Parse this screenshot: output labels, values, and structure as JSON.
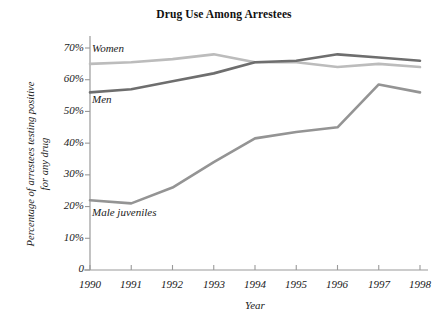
{
  "chart_data": {
    "type": "line",
    "title": "Drug Use Among Arrestees",
    "xlabel": "Year",
    "ylabel": "Percentage of arrestees testing positive\nfor any drug",
    "categories": [
      "1990",
      "1991",
      "1992",
      "1993",
      "1994",
      "1995",
      "1996",
      "1997",
      "1998"
    ],
    "x": [
      1990,
      1991,
      1992,
      1993,
      1994,
      1995,
      1996,
      1997,
      1998
    ],
    "xlim": [
      1990,
      1998
    ],
    "ylim": [
      0,
      72
    ],
    "yticks": [
      0,
      10,
      20,
      30,
      40,
      50,
      60,
      70
    ],
    "ytick_labels": [
      "0",
      "10%",
      "20%",
      "30%",
      "40%",
      "50%",
      "60%",
      "70%"
    ],
    "grid": false,
    "legend_position": "inline-labels",
    "series": [
      {
        "name": "Women",
        "color": "#bcbcbc",
        "values": [
          65,
          65.5,
          66.5,
          68,
          65.5,
          65.5,
          64,
          65,
          64
        ]
      },
      {
        "name": "Men",
        "color": "#6e6e6e",
        "values": [
          56,
          57,
          59.5,
          62,
          65.5,
          66,
          68,
          67,
          66
        ]
      },
      {
        "name": "Male juveniles",
        "color": "#949494",
        "values": [
          22,
          21,
          26,
          34,
          41.5,
          43.5,
          45,
          58.5,
          56
        ]
      }
    ],
    "annotations": [
      {
        "text": "Women",
        "series": "Women"
      },
      {
        "text": "Men",
        "series": "Men"
      },
      {
        "text": "Male juveniles",
        "series": "Male juveniles"
      }
    ],
    "axis_color": "#9a9a9a"
  }
}
